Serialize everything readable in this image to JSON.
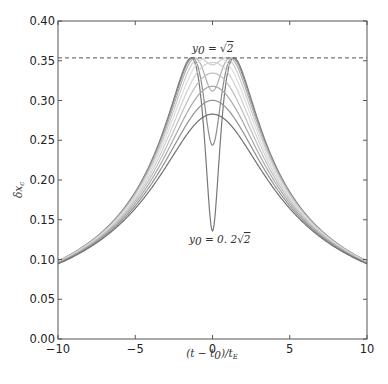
{
  "chart_data": {
    "type": "line",
    "title": "",
    "xlabel": "(t − t_0)/t_E",
    "ylabel": "δx_c",
    "xlim": [
      -10,
      10
    ],
    "ylim": [
      0.0,
      0.4
    ],
    "xticks": [
      -10,
      -5,
      0,
      5,
      10
    ],
    "xtick_labels": [
      "−10",
      "−5",
      "0",
      "5",
      "10"
    ],
    "yticks": [
      0.0,
      0.05,
      0.1,
      0.15,
      0.2,
      0.25,
      0.3,
      0.35,
      0.4
    ],
    "ytick_labels": [
      "0.00",
      "0.05",
      "0.10",
      "0.15",
      "0.20",
      "0.25",
      "0.30",
      "0.35",
      "0.40"
    ],
    "grid": false,
    "legend": null,
    "formula": "δx_c = u/(u²+2), u = sqrt(y0² + ((t−t0)/tE)²)",
    "series": [
      {
        "name": "y0 = 0.2√2",
        "y0": 0.2828,
        "color": "#777777"
      },
      {
        "name": "y0 = 0.4√2",
        "y0": 0.5657,
        "color": "#8c8c8c"
      },
      {
        "name": "y0 = 0.6√2",
        "y0": 0.8485,
        "color": "#b0b0b0"
      },
      {
        "name": "y0 = 0.8√2",
        "y0": 1.1314,
        "color": "#cccccc"
      },
      {
        "name": "y0 = √2",
        "y0": 1.4142,
        "color": "#dddddd"
      },
      {
        "name": "y0 = 1.2√2",
        "y0": 1.6971,
        "color": "#d0d0d0"
      },
      {
        "name": "y0 = 1.4√2",
        "y0": 1.9799,
        "color": "#bdbdbd"
      },
      {
        "name": "y0 = 1.6√2",
        "y0": 2.2627,
        "color": "#a8a8a8"
      },
      {
        "name": "y0 = 1.8√2",
        "y0": 2.5456,
        "color": "#909090"
      },
      {
        "name": "y0 = 2√2",
        "y0": 2.8284,
        "color": "#707070"
      }
    ],
    "sample_values_at_t0": [
      0.136,
      0.244,
      0.312,
      0.345,
      0.354,
      0.348,
      0.334,
      0.318,
      0.3,
      0.283
    ],
    "reference_line": {
      "y": 0.3536,
      "style": "dashed",
      "label": "1/(2√2)"
    },
    "annotations": [
      {
        "text": "y0 = √2",
        "x": 0.5,
        "y": 0.365
      },
      {
        "text": "y0 = 0.2√2",
        "x": 0.5,
        "y": 0.12
      }
    ]
  },
  "labels": {
    "xlabel_parts": {
      "open": "(",
      "t": "t",
      "minus": " − ",
      "t0": "t",
      "sub0": "0",
      "close": ")/",
      "tE": "t",
      "subE": "E"
    },
    "ylabel_parts": {
      "delta": "δ",
      "x": "x",
      "sub": "c"
    },
    "annotation_top": {
      "y": "y",
      "sub": "0",
      "eq": " = ",
      "sqrt": "√",
      "val": "2"
    },
    "annotation_bottom": {
      "y": "y",
      "sub": "0",
      "eq": " = 0. 2",
      "sqrt": "√",
      "val": "2"
    }
  }
}
